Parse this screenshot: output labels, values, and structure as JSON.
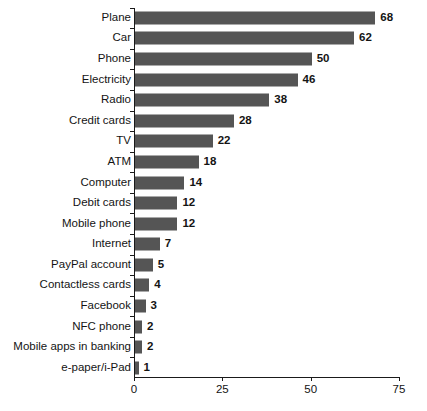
{
  "chart_data": {
    "type": "bar",
    "orientation": "horizontal",
    "title": "",
    "subtitle": "",
    "xlabel": "",
    "ylabel": "",
    "xlim": [
      0,
      75
    ],
    "xticks": [
      0,
      25,
      50,
      75
    ],
    "xtick_labels": [
      "0",
      "25",
      "50",
      "75"
    ],
    "grid": false,
    "legend": null,
    "bar_color": "#555555",
    "axis_color": "#1a1a1a",
    "text_color": "#141414",
    "categories": [
      "Plane",
      "Car",
      "Phone",
      "Electricity",
      "Radio",
      "Credit cards",
      "TV",
      "ATM",
      "Computer",
      "Debit cards",
      "Mobile phone",
      "Internet",
      "PayPal account",
      "Contactless cards",
      "Facebook",
      "NFC phone",
      "Mobile apps in banking",
      "e-paper/i-Pad"
    ],
    "values": [
      68,
      62,
      50,
      46,
      38,
      28,
      22,
      18,
      14,
      12,
      12,
      7,
      5,
      4,
      3,
      2,
      2,
      1
    ],
    "value_labels": [
      "68",
      "62",
      "50",
      "46",
      "38",
      "28",
      "22",
      "18",
      "14",
      "12",
      "12",
      "7",
      "5",
      "4",
      "3",
      "2",
      "2",
      "1"
    ]
  }
}
